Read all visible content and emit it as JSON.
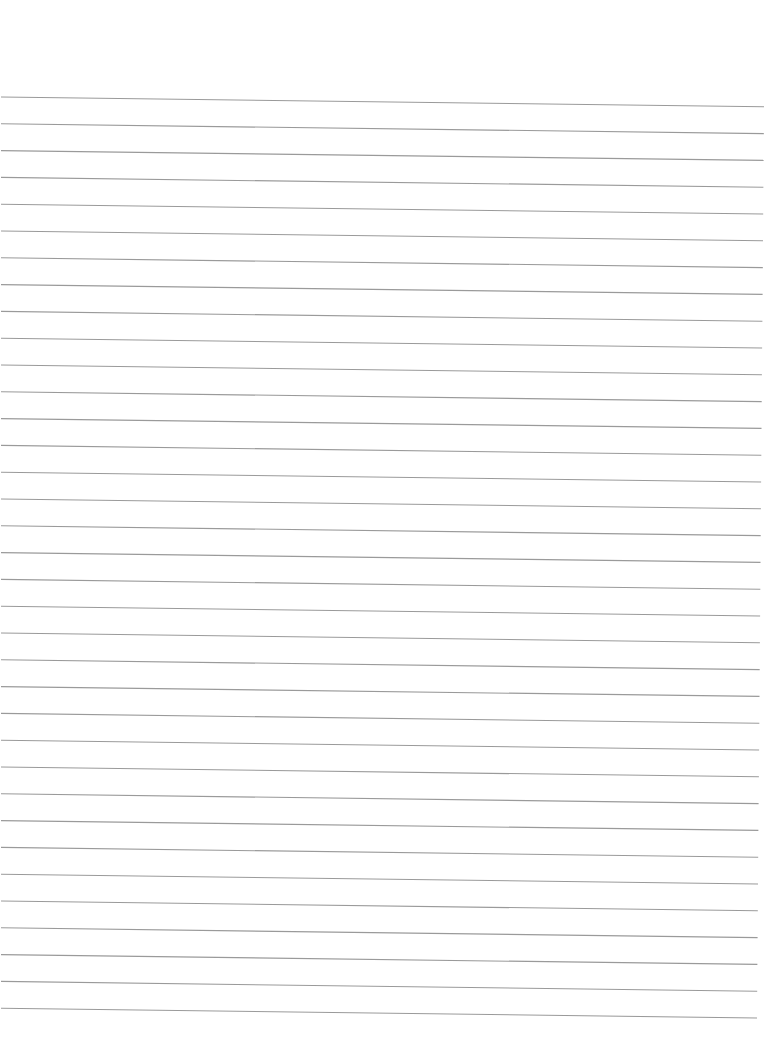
{
  "page": {
    "type": "blank lined paper",
    "background": "#ffffff",
    "text_content": []
  },
  "ruling": {
    "line_count": 35,
    "line_color": "#9a9a9a",
    "line_width": 1.1,
    "first_line_left_y": 97,
    "first_line_right_y": 107,
    "spacing": 26.8,
    "left_x": 1,
    "right_x_top": 764,
    "right_x_bottom": 757,
    "slope_drop": 9.8
  }
}
